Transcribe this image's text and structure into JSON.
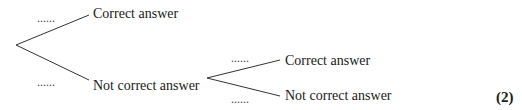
{
  "tree": {
    "first_level": {
      "branches": [
        {
          "blank": "......",
          "outcome": "Correct answer"
        },
        {
          "blank": "......",
          "outcome": "Not correct answer"
        }
      ]
    },
    "second_level": {
      "from": "Not correct answer",
      "branches": [
        {
          "blank": "......",
          "outcome": "Correct answer"
        },
        {
          "blank": "......",
          "outcome": "Not correct answer"
        }
      ]
    }
  },
  "marks": "(2)"
}
